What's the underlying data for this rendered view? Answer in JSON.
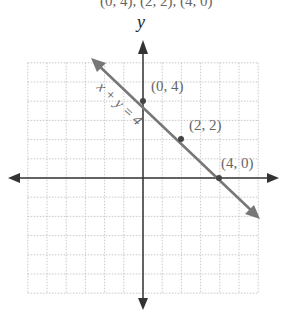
{
  "header_partial": "(0, 4), (2, 2), (4, 0)",
  "graph": {
    "y_axis_label": "y",
    "equation": "x + y = 4",
    "points": [
      {
        "x": 0,
        "y": 4,
        "label": "(0, 4)"
      },
      {
        "x": 2,
        "y": 2,
        "label": "(2, 2)"
      },
      {
        "x": 4,
        "y": 0,
        "label": "(4, 0)"
      }
    ],
    "grid": {
      "xmin": -6,
      "xmax": 6,
      "ymin": -6,
      "ymax": 6
    },
    "colors": {
      "line": "#666666",
      "axis": "#333333",
      "grid": "#bbbbbb",
      "point": "#444444"
    }
  }
}
